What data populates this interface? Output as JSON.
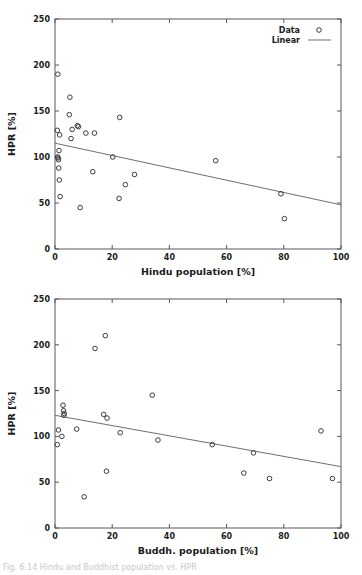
{
  "page": {
    "background": "#ffffff",
    "caption_fragment": "Fig. 6.14 Hindu and Buddhist population vs. HPR",
    "marker_color": "#3b3b3f",
    "fit_color": "#6e6e72",
    "axis_color": "#59595c"
  },
  "chart_data": [
    {
      "type": "scatter",
      "id": "hindu",
      "title": "",
      "xlabel": "Hindu population [%]",
      "ylabel": "HPR [%]",
      "xlim": [
        0,
        100
      ],
      "ylim": [
        0,
        250
      ],
      "xticks": [
        0,
        20,
        40,
        60,
        80,
        100
      ],
      "yticks": [
        0,
        50,
        100,
        150,
        200,
        250
      ],
      "xtick_labels": [
        "0",
        "20",
        "40",
        "60",
        "80",
        "100"
      ],
      "ytick_labels": [
        "0",
        "50",
        "100",
        "150",
        "200",
        "250"
      ],
      "grid": false,
      "legend_position": "top-right",
      "legend": [
        {
          "label": "Data",
          "marker": "circle"
        },
        {
          "label": "Linear",
          "marker": "line"
        }
      ],
      "series": [
        {
          "name": "Data",
          "points": [
            [
              1.0,
              190
            ],
            [
              0.8,
              129
            ],
            [
              1.6,
              124
            ],
            [
              1.4,
              107
            ],
            [
              0.9,
              100
            ],
            [
              1.1,
              99
            ],
            [
              1.2,
              97
            ],
            [
              1.3,
              88
            ],
            [
              1.5,
              75
            ],
            [
              1.8,
              57
            ],
            [
              5.2,
              165
            ],
            [
              5.0,
              146
            ],
            [
              6.0,
              130
            ],
            [
              5.6,
              120
            ],
            [
              7.8,
              134
            ],
            [
              8.2,
              133
            ],
            [
              8.8,
              45
            ],
            [
              10.8,
              126
            ],
            [
              13.2,
              84
            ],
            [
              13.8,
              126
            ],
            [
              20.2,
              100
            ],
            [
              22.6,
              143
            ],
            [
              22.4,
              55
            ],
            [
              24.6,
              70
            ],
            [
              27.8,
              81
            ],
            [
              56.2,
              96
            ],
            [
              79.0,
              60
            ],
            [
              80.2,
              33
            ]
          ]
        }
      ],
      "fit": {
        "name": "Linear",
        "x": [
          0,
          100
        ],
        "y": [
          115,
          48
        ]
      }
    },
    {
      "type": "scatter",
      "id": "buddh",
      "title": "",
      "xlabel": "Buddh. population [%]",
      "ylabel": "HPR [%]",
      "xlim": [
        0,
        100
      ],
      "ylim": [
        0,
        250
      ],
      "xticks": [
        0,
        20,
        40,
        60,
        80,
        100
      ],
      "yticks": [
        0,
        50,
        100,
        150,
        200,
        250
      ],
      "xtick_labels": [
        "0",
        "20",
        "40",
        "60",
        "80",
        "100"
      ],
      "ytick_labels": [
        "0",
        "50",
        "100",
        "150",
        "200",
        "250"
      ],
      "grid": false,
      "legend_position": "none",
      "legend": [],
      "series": [
        {
          "name": "Data",
          "points": [
            [
              0.8,
              91
            ],
            [
              1.2,
              107
            ],
            [
              2.4,
              100
            ],
            [
              2.8,
              134
            ],
            [
              3.0,
              128
            ],
            [
              3.2,
              125
            ],
            [
              3.1,
              123
            ],
            [
              7.6,
              108
            ],
            [
              10.2,
              34
            ],
            [
              14.0,
              196
            ],
            [
              17.0,
              124
            ],
            [
              17.6,
              210
            ],
            [
              18.2,
              120
            ],
            [
              18.0,
              62
            ],
            [
              22.8,
              104
            ],
            [
              34.0,
              145
            ],
            [
              36.0,
              96
            ],
            [
              55.0,
              91
            ],
            [
              66.0,
              60
            ],
            [
              69.4,
              82
            ],
            [
              75.0,
              54
            ],
            [
              93.0,
              106
            ],
            [
              97.0,
              54
            ]
          ]
        }
      ],
      "fit": {
        "name": "Linear",
        "x": [
          0,
          100
        ],
        "y": [
          123,
          67
        ]
      }
    }
  ]
}
